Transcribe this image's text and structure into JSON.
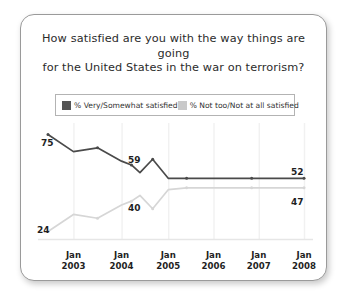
{
  "card": {
    "title_line1": "How satisfied are you with the way things are going",
    "title_line2": "for the United States in the war on terrorism?"
  },
  "legend": {
    "series1_label": "% Very/Somewhat satisfied",
    "series2_label": "% Not too/Not at all satisfied",
    "series1_color": "#555555",
    "series2_color": "#c9c9c9"
  },
  "chart_data": {
    "type": "line",
    "title": "How satisfied are you with the way things are going for the United States in the war on terrorism?",
    "xlabel": "",
    "ylabel": "",
    "ylim": [
      0,
      100
    ],
    "grid": "vertical",
    "legend_position": "top",
    "categories": [
      "Jan 2003",
      "Jan 2004",
      "Jan 2005",
      "Jan 2006",
      "Jan 2007",
      "Jan 2008"
    ],
    "tick_labels": [
      {
        "line1": "Jan",
        "line2": "2003"
      },
      {
        "line1": "Jan",
        "line2": "2004"
      },
      {
        "line1": "Jan",
        "line2": "2005"
      },
      {
        "line1": "Jan",
        "line2": "2006"
      },
      {
        "line1": "Jan",
        "line2": "2007"
      },
      {
        "line1": "Jan",
        "line2": "2008"
      }
    ],
    "series": [
      {
        "name": "% Very/Somewhat satisfied",
        "color": "#4a4a4a",
        "values": [
          75,
          66,
          68,
          61,
          59,
          55,
          62,
          52,
          52,
          52,
          52,
          52,
          52
        ],
        "x": [
          0.0,
          0.9,
          1.75,
          2.6,
          2.95,
          3.25,
          3.7,
          4.25,
          4.9,
          6.0,
          7.2,
          8.3,
          9.05
        ]
      },
      {
        "name": "% Not too/Not at all satisfied",
        "color": "#d6d6d6",
        "values": [
          24,
          33,
          31,
          38,
          40,
          43,
          36,
          46,
          47,
          47,
          47,
          47,
          47
        ],
        "x": [
          0.0,
          0.9,
          1.75,
          2.6,
          2.95,
          3.25,
          3.7,
          4.25,
          4.9,
          6.0,
          7.2,
          8.3,
          9.05
        ]
      }
    ],
    "annotations": [
      {
        "text": "75",
        "series": "% Very/Somewhat satisfied",
        "value": 75,
        "position": "above-left"
      },
      {
        "text": "59",
        "series": "% Very/Somewhat satisfied",
        "value": 59,
        "position": "above"
      },
      {
        "text": "52",
        "series": "% Very/Somewhat satisfied",
        "value": 52,
        "position": "above-right"
      },
      {
        "text": "24",
        "series": "% Not too/Not at all satisfied",
        "value": 24,
        "position": "below-left"
      },
      {
        "text": "40",
        "series": "% Not too/Not at all satisfied",
        "value": 40,
        "position": "below"
      },
      {
        "text": "47",
        "series": "% Not too/Not at all satisfied",
        "value": 47,
        "position": "below-right"
      }
    ]
  }
}
